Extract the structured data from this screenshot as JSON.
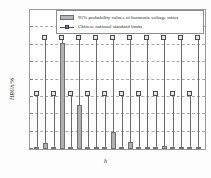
{
  "chart_data": {
    "type": "bar",
    "title": "",
    "xlabel": "h",
    "ylabel": "HRUh/%",
    "xlim": [
      1.2,
      21.8
    ],
    "ylim": [
      0,
      4
    ],
    "grid": true,
    "legend_position": "top",
    "x": [
      2,
      3,
      4,
      5,
      6,
      7,
      8,
      9,
      10,
      11,
      12,
      13,
      14,
      15,
      16,
      17,
      18,
      19,
      20,
      21
    ],
    "xtick_labels": [
      "2",
      "4",
      "6",
      "8",
      "10",
      "12",
      "14",
      "16",
      "18",
      "20"
    ],
    "xtick_values": [
      2,
      4,
      6,
      8,
      10,
      12,
      14,
      16,
      18,
      20
    ],
    "ytick_labels": [
      "0",
      "0.5",
      "1",
      "1.5",
      "2",
      "2.5",
      "3",
      "3.5",
      "4"
    ],
    "ytick_values": [
      0,
      0.5,
      1,
      1.5,
      2,
      2.5,
      3,
      3.5,
      4
    ],
    "series": [
      {
        "name": "95% probability values of harmonic voltage ratios",
        "kind": "bar",
        "values": [
          0.03,
          0.18,
          0.06,
          3.05,
          0.03,
          1.27,
          0.06,
          0.03,
          0.02,
          0.48,
          0.02,
          0.2,
          0.01,
          0.02,
          0.02,
          0.08,
          0.01,
          0.03,
          0.01,
          0.02
        ]
      },
      {
        "name": "Chinese national standard limits",
        "kind": "stem",
        "values": [
          1.6,
          3.2,
          1.6,
          3.2,
          1.6,
          3.2,
          1.6,
          3.2,
          1.6,
          3.2,
          1.6,
          3.2,
          1.6,
          3.2,
          1.6,
          3.2,
          1.6,
          3.2,
          1.6,
          3.2
        ]
      }
    ]
  },
  "legend": {
    "items": [
      {
        "label": "95% probability values of harmonic voltage ratios",
        "marker": "bar-swatch"
      },
      {
        "label": "Chinese national standard limits",
        "marker": "stem-square-marker"
      }
    ]
  },
  "axes": {
    "x_title": "h",
    "y_title": "HRUh/%"
  }
}
